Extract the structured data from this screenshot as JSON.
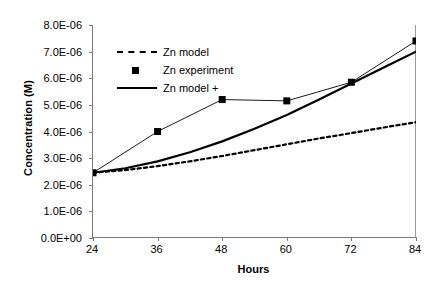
{
  "chart_data": {
    "type": "line",
    "title": "",
    "xlabel": "Hours",
    "ylabel": "Concentration (M)",
    "xlim": [
      24,
      84
    ],
    "ylim": [
      0,
      8e-06
    ],
    "grid": false,
    "legend_position": "upper-left-inside",
    "x_tick_labels": [
      "24",
      "36",
      "48",
      "60",
      "72",
      "84"
    ],
    "x_ticks": [
      24,
      36,
      48,
      60,
      72,
      84
    ],
    "y_tick_labels": [
      "0.0E+00",
      "1.0E-06",
      "2.0E-06",
      "3.0E-06",
      "4.0E-06",
      "5.0E-06",
      "6.0E-06",
      "7.0E-06",
      "8.0E-06"
    ],
    "y_ticks": [
      0,
      1e-06,
      2e-06,
      3e-06,
      4e-06,
      5e-06,
      6e-06,
      7e-06,
      8e-06
    ],
    "series": [
      {
        "name": "Zn model",
        "style": "dashed",
        "marker": "none",
        "color": "#000000",
        "x": [
          24,
          30,
          36,
          42,
          48,
          54,
          60,
          66,
          72,
          78,
          84
        ],
        "values": [
          2.45e-06,
          2.55e-06,
          2.7e-06,
          2.88e-06,
          3.08e-06,
          3.3e-06,
          3.52e-06,
          3.74e-06,
          3.94e-06,
          4.15e-06,
          4.35e-06
        ]
      },
      {
        "name": "Zn  experiment",
        "style": "solid-thin",
        "marker": "square",
        "color": "#000000",
        "x": [
          24,
          36,
          48,
          60,
          72,
          84
        ],
        "values": [
          2.45e-06,
          4e-06,
          5.2e-06,
          5.15e-06,
          5.85e-06,
          7.4e-06
        ]
      },
      {
        "name": "Zn model +",
        "style": "solid",
        "marker": "none",
        "color": "#000000",
        "x": [
          24,
          30,
          36,
          42,
          48,
          54,
          60,
          66,
          72,
          78,
          84
        ],
        "values": [
          2.45e-06,
          2.62e-06,
          2.88e-06,
          3.22e-06,
          3.63e-06,
          4.1e-06,
          4.62e-06,
          5.2e-06,
          5.8e-06,
          6.4e-06,
          7e-06
        ]
      }
    ]
  },
  "axes": {
    "y_title": "Concentration (M)",
    "x_title": "Hours"
  },
  "legend": {
    "items": [
      {
        "label": "Zn model",
        "key": "dashed-line-key"
      },
      {
        "label": "Zn  experiment",
        "key": "square-marker-key"
      },
      {
        "label": "Zn model +",
        "key": "solid-line-key"
      }
    ]
  }
}
